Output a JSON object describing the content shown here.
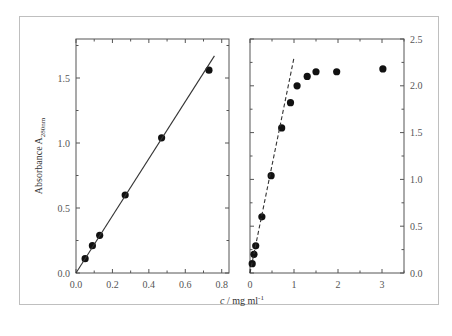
{
  "chart_data": [
    {
      "type": "scatter",
      "panel": "left",
      "title": "",
      "xlabel": "c / mg ml-1",
      "ylabel": "Absorbance A280nm",
      "xlim": [
        0,
        0.84
      ],
      "ylim": [
        0,
        1.8
      ],
      "x_ticks": [
        "0.0",
        "0.2",
        "0.4",
        "0.6",
        "0.8"
      ],
      "y_ticks": [
        "0.0",
        "0.5",
        "1.0",
        "1.5"
      ],
      "grid": false,
      "series": [
        {
          "name": "measured",
          "style": "filled-circle",
          "x": [
            0.05,
            0.09,
            0.13,
            0.27,
            0.47,
            0.73
          ],
          "y": [
            0.11,
            0.21,
            0.29,
            0.6,
            1.04,
            1.56
          ]
        },
        {
          "name": "linear fit",
          "style": "solid-line",
          "x": [
            0.0,
            0.76
          ],
          "y": [
            0.0,
            1.67
          ]
        }
      ]
    },
    {
      "type": "scatter",
      "panel": "right",
      "title": "",
      "xlabel": "c / mg ml-1",
      "ylabel": "",
      "xlim": [
        0,
        3.5
      ],
      "ylim": [
        0,
        2.5
      ],
      "x_ticks": [
        "0",
        "1",
        "2",
        "3"
      ],
      "y_ticks": [
        "0.0",
        "0.5",
        "1.0",
        "1.5",
        "2.0",
        "2.5"
      ],
      "y_axis_position": "right",
      "grid": false,
      "series": [
        {
          "name": "measured",
          "style": "filled-circle",
          "x": [
            0.05,
            0.09,
            0.13,
            0.27,
            0.48,
            0.72,
            0.92,
            1.07,
            1.3,
            1.5,
            1.97,
            3.02
          ],
          "y": [
            0.1,
            0.2,
            0.29,
            0.6,
            1.04,
            1.55,
            1.82,
            2.0,
            2.1,
            2.15,
            2.15,
            2.18
          ]
        },
        {
          "name": "linear extrapolation",
          "style": "dashed-line",
          "x": [
            0.0,
            1.0
          ],
          "y": [
            0.0,
            2.3
          ]
        }
      ]
    }
  ],
  "labels": {
    "ylabel_main": "Absorbance A",
    "ylabel_sub": "280nm",
    "xlabel_italic": "c",
    "xlabel_rest": " / mg ml",
    "xlabel_sup": "-1"
  }
}
